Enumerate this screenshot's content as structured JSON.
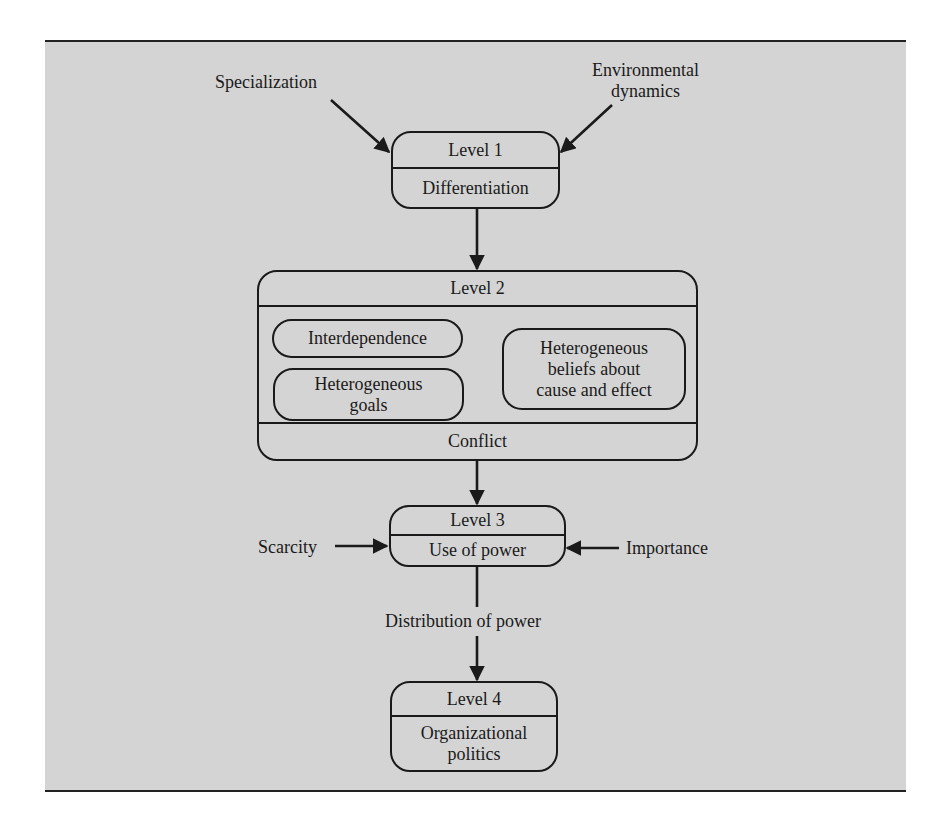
{
  "diagram": {
    "inputs_level1": [
      {
        "id": "specialization",
        "label": "Specialization"
      },
      {
        "id": "environmental_dynamics",
        "label_lines": [
          "Environmental",
          "dynamics"
        ]
      }
    ],
    "level1": {
      "title": "Level 1",
      "content": "Differentiation"
    },
    "level2": {
      "title": "Level 2",
      "factors": [
        {
          "label_lines": [
            "Interdependence"
          ]
        },
        {
          "label_lines": [
            "Heterogeneous",
            "goals"
          ]
        },
        {
          "label_lines": [
            "Heterogeneous",
            "beliefs about",
            "cause and effect"
          ]
        }
      ],
      "outcome": "Conflict"
    },
    "inputs_level3": [
      {
        "id": "scarcity",
        "label": "Scarcity"
      },
      {
        "id": "importance",
        "label": "Importance"
      }
    ],
    "level3": {
      "title": "Level 3",
      "content": "Use of power"
    },
    "link_3_to_4": "Distribution of power",
    "level4": {
      "title": "Level 4",
      "content_lines": [
        "Organizational",
        "politics"
      ]
    },
    "colors": {
      "panel_bg": "#d4d4d4",
      "stroke": "#1a1a1a",
      "page_bg": "#ffffff"
    }
  }
}
